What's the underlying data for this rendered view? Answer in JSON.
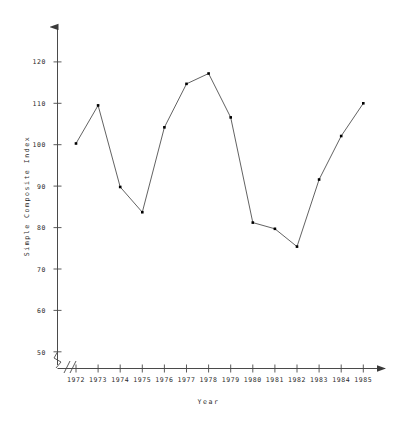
{
  "chart_data": {
    "type": "line",
    "title": "",
    "subtitle": "",
    "xlabel": "Year",
    "ylabel": "Simple Composite Index",
    "categories": [
      "1972",
      "1973",
      "1974",
      "1975",
      "1976",
      "1977",
      "1978",
      "1979",
      "1980",
      "1981",
      "1982",
      "1983",
      "1984",
      "1985"
    ],
    "x": [
      1972,
      1973,
      1974,
      1975,
      1976,
      1977,
      1978,
      1979,
      1980,
      1981,
      1982,
      1983,
      1984,
      1985
    ],
    "values": [
      100.3,
      109.5,
      89.8,
      83.7,
      104.2,
      114.7,
      117.2,
      106.6,
      81.2,
      79.7,
      75.4,
      91.6,
      102.1,
      110.0
    ],
    "series": [
      {
        "name": "Simple Composite Index",
        "values": [
          100.3,
          109.5,
          89.8,
          83.7,
          104.2,
          114.7,
          117.2,
          106.6,
          81.2,
          79.7,
          75.4,
          91.6,
          102.1,
          110.0
        ]
      }
    ],
    "xticks": [
      "1972",
      "1973",
      "1974",
      "1975",
      "1976",
      "1977",
      "1978",
      "1979",
      "1980",
      "1981",
      "1982",
      "1983",
      "1984",
      "1985"
    ],
    "yticks": [
      50,
      60,
      70,
      80,
      90,
      100,
      110,
      120
    ],
    "ytick_labels": [
      "50",
      "60",
      "70",
      "80",
      "90",
      "100",
      "110",
      "120"
    ],
    "ylim": [
      44,
      127
    ],
    "xlim": [
      1971.3,
      1986.3
    ],
    "grid": false,
    "legend": false,
    "legend_position": "none",
    "axis_break": true,
    "axis_break_symbol": "//",
    "marker": "filled-square",
    "line_color": "#333333",
    "marker_color": "#000000",
    "axis_color": "#555555",
    "background_color": "#ffffff",
    "annotations": []
  },
  "axes": {
    "y_axis_title": "Simple Composite Index",
    "x_axis_title": "Year",
    "y_arrow": true,
    "x_arrow": true
  }
}
